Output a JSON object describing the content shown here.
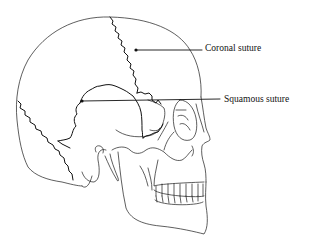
{
  "diagram": {
    "labels": [
      {
        "id": "coronal",
        "text": "Coronal suture"
      },
      {
        "id": "squamous",
        "text": "Squamous suture"
      }
    ],
    "colors": {
      "line": "#111111",
      "background": "#ffffff"
    }
  }
}
